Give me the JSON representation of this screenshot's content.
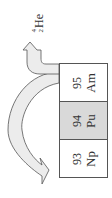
{
  "diagram": {
    "elements": [
      {
        "number": "95",
        "symbol": "Am",
        "fill": "#ececec"
      },
      {
        "number": "94",
        "symbol": "Pu",
        "fill": "#d9d9d9"
      },
      {
        "number": "93",
        "symbol": "Np",
        "fill": "#ececec"
      }
    ],
    "emitted_particle": {
      "mass_number": "4",
      "atomic_number": "2",
      "symbol": "He"
    },
    "arrows": [
      {
        "from": "Am",
        "to": "He",
        "meaning": "alpha emission"
      },
      {
        "from": "Am",
        "to": "Np",
        "meaning": "decay to Z-2"
      }
    ],
    "colors": {
      "arrow_fill": "#ececec",
      "stroke": "#555555"
    }
  }
}
